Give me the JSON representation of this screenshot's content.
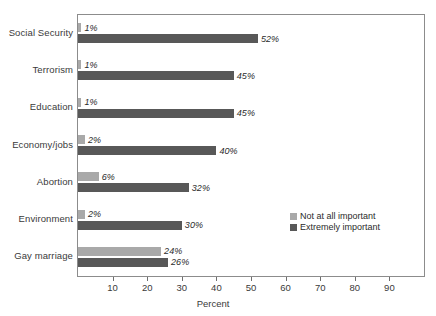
{
  "chart_data": {
    "type": "bar",
    "orientation": "horizontal",
    "title": "",
    "xlabel": "Percent",
    "ylabel": "",
    "xlim": [
      0,
      100
    ],
    "xticks": [
      10,
      20,
      30,
      40,
      50,
      60,
      70,
      80,
      90
    ],
    "grid": false,
    "legend_position": "inside lower-right",
    "value_label_suffix": "%",
    "categories": [
      "Social Security",
      "Terrorism",
      "Education",
      "Economy/jobs",
      "Abortion",
      "Environment",
      "Gay marriage"
    ],
    "series": [
      {
        "name": "Not at all important",
        "color": "#a9a9a9",
        "values": [
          1,
          1,
          1,
          2,
          6,
          2,
          24
        ],
        "labels": [
          "1%",
          "1%",
          "1%",
          "2%",
          "6%",
          "2%",
          "24%"
        ]
      },
      {
        "name": "Extremely important",
        "color": "#585858",
        "values": [
          52,
          45,
          45,
          40,
          32,
          30,
          26
        ],
        "labels": [
          "52%",
          "45%",
          "45%",
          "40%",
          "32%",
          "30%",
          "26%"
        ]
      }
    ]
  },
  "axis": {
    "x_title": "Percent",
    "tick_labels": [
      "10",
      "20",
      "30",
      "40",
      "50",
      "60",
      "70",
      "80",
      "90"
    ]
  },
  "legend": {
    "entries": [
      {
        "label": "Not at all important",
        "color": "#a9a9a9"
      },
      {
        "label": "Extremely important",
        "color": "#585858"
      }
    ]
  },
  "colors": {
    "series_light": "#a9a9a9",
    "series_dark": "#585858",
    "frame": "#8c8c8c",
    "text": "#2b2b2b",
    "background": "#ffffff"
  }
}
